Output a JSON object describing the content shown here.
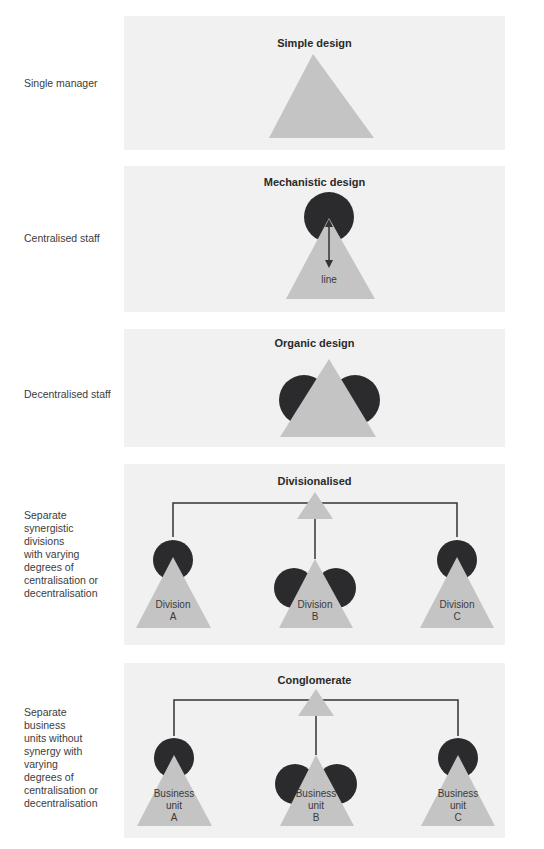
{
  "colors": {
    "panel_bg": "#f1f1f1",
    "triangle": "#c4c4c4",
    "circle": "#2b2b2e",
    "line": "#333333"
  },
  "rows": [
    {
      "label": "Single manager",
      "title": "Simple design"
    },
    {
      "label": "Centralised staff",
      "title": "Mechanistic design",
      "annotation": "line"
    },
    {
      "label": "Decentralised staff",
      "title": "Organic design"
    },
    {
      "label": "Separate\nsynergistic\ndivisions\nwith varying\ndegrees of\ncentralisation or\ndecentralisation",
      "title": "Divisionalised",
      "units": [
        "Division\nA",
        "Division\nB",
        "Division\nC"
      ]
    },
    {
      "label": "Separate\nbusiness\nunits without\nsynergy with\nvarying\ndegrees of\ncentralisation or\ndecentralisation",
      "title": "Conglomerate",
      "units": [
        "Business\nunit\nA",
        "Business\nunit\nB",
        "Business\nunit\nC"
      ]
    }
  ]
}
